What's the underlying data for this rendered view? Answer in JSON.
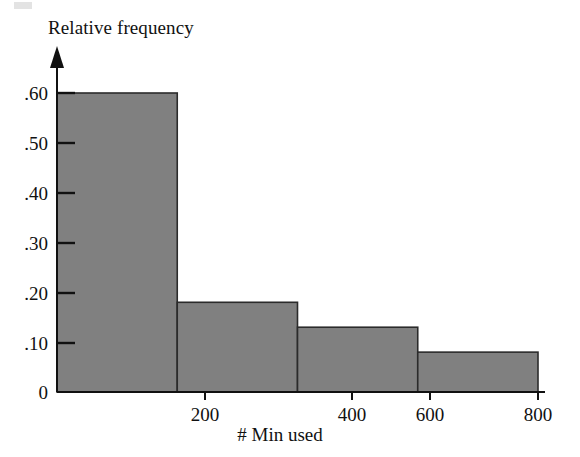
{
  "figure": {
    "y_axis_title": "Relative frequency",
    "x_axis_title": "# Min used",
    "bar_fill_color": "#808080",
    "bar_stroke_color": "#2b2b2b",
    "axis_color": "#111111"
  },
  "y_ticks": [
    {
      "label": ".60",
      "value": 0.6
    },
    {
      "label": ".50",
      "value": 0.5
    },
    {
      "label": ".40",
      "value": 0.4
    },
    {
      "label": ".30",
      "value": 0.3
    },
    {
      "label": ".20",
      "value": 0.2
    },
    {
      "label": ".10",
      "value": 0.1
    },
    {
      "label": "0",
      "value": 0.0
    }
  ],
  "x_ticks": [
    {
      "label": "200",
      "value": 200
    },
    {
      "label": "400",
      "value": 400
    },
    {
      "label": "600",
      "value": 600
    },
    {
      "label": "800",
      "value": 800
    }
  ],
  "chart_data": {
    "type": "bar",
    "title": "",
    "subtitle": "",
    "xlabel": "# Min used",
    "ylabel": "Relative frequency",
    "categories": [
      "0-200",
      "200-400",
      "400-600",
      "600-800"
    ],
    "bin_edges": [
      0,
      200,
      400,
      600,
      800
    ],
    "values": [
      0.6,
      0.18,
      0.13,
      0.08
    ],
    "xlim": [
      0,
      800
    ],
    "ylim": [
      0,
      0.65
    ],
    "ytick_labels": [
      ".60",
      ".50",
      ".40",
      ".30",
      ".20",
      ".10",
      "0"
    ],
    "ytick_values": [
      0.6,
      0.5,
      0.4,
      0.3,
      0.2,
      0.1,
      0
    ],
    "xtick_labels": [
      "200",
      "400",
      "600",
      "800"
    ],
    "xtick_values": [
      200,
      400,
      600,
      800
    ],
    "grid": false,
    "legend": false,
    "legend_position": "none",
    "bar_color": "#808080",
    "annotations": []
  }
}
